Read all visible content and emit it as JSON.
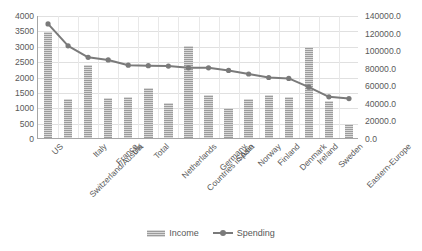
{
  "chart_data": {
    "type": "bar",
    "title": "",
    "subtitle": "",
    "xlabel": "",
    "ylabel": "",
    "grid": true,
    "legend_position": "bottom",
    "categories": [
      "US",
      "Switzerland/Austria",
      "Italy",
      "France",
      "UK",
      "Total",
      "Netherlands",
      "Countries in Asia",
      "Germany",
      "Spain",
      "Norway",
      "Finland",
      "Denmark",
      "Ireland",
      "Sweden",
      "Eastern-Europe"
    ],
    "series": [
      {
        "name": "Income",
        "type": "bar",
        "axis": "left",
        "color": "#9c9c9c",
        "values": [
          3440,
          1280,
          2370,
          1300,
          1340,
          1640,
          1150,
          2990,
          1400,
          980,
          1260,
          1400,
          1330,
          2950,
          1200,
          450
        ]
      },
      {
        "name": "Spending",
        "type": "line",
        "axis": "right",
        "color": "#7a7a7a",
        "values": [
          131000,
          106000,
          93000,
          90000,
          84000,
          83500,
          83000,
          81000,
          81000,
          78000,
          74000,
          70000,
          69000,
          59000,
          48000,
          46000
        ]
      }
    ],
    "left_axis": {
      "min": 0,
      "max": 4000,
      "step": 500,
      "ticks": [
        "0",
        "500",
        "1000",
        "1500",
        "2000",
        "2500",
        "3000",
        "3500",
        "4000"
      ]
    },
    "right_axis": {
      "min": 0,
      "max": 140000,
      "step": 20000,
      "ticks": [
        "0.0",
        "20000.0",
        "40000.0",
        "60000.0",
        "80000.0",
        "100000.0",
        "120000.0",
        "140000.0"
      ]
    },
    "legend": [
      {
        "label": "Income",
        "marker": "bar-swatch",
        "color": "#9c9c9c"
      },
      {
        "label": "Spending",
        "marker": "line-marker",
        "color": "#7a7a7a"
      }
    ]
  }
}
